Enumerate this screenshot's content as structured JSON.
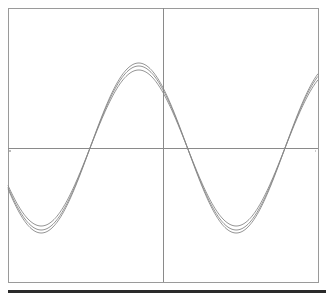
{
  "chart_data": {
    "type": "line",
    "title": "",
    "xlabel": "",
    "ylabel": "",
    "grid": false,
    "legend": null,
    "frame": {
      "left": 8,
      "top": 8,
      "right": 318,
      "bottom": 282
    },
    "axes_origin_px": {
      "x": 163,
      "y": 148
    },
    "x_range_px": [
      8,
      318
    ],
    "series": [
      {
        "name": "curve-1",
        "amplitude_px": 78,
        "period_px": 195,
        "zero_cross_up_px": 90,
        "color": "#888888"
      },
      {
        "name": "curve-2",
        "amplitude_px": 82,
        "period_px": 195,
        "zero_cross_up_px": 90,
        "color": "#888888"
      },
      {
        "name": "curve-3",
        "amplitude_px": 85,
        "period_px": 195,
        "zero_cross_up_px": 90,
        "color": "#888888"
      }
    ],
    "key_points_px": {
      "peak": [
        139,
        66
      ],
      "trough_left": [
        41,
        222
      ],
      "trough_right": [
        236,
        222
      ],
      "zero_crossings": [
        90,
        187,
        285
      ]
    }
  },
  "colors": {
    "frame": "#9a9a9a",
    "axis": "#8a8a8a",
    "curve": "#8c8c8c",
    "bottom_bar": "#2a2a2a",
    "background": "#ffffff"
  }
}
